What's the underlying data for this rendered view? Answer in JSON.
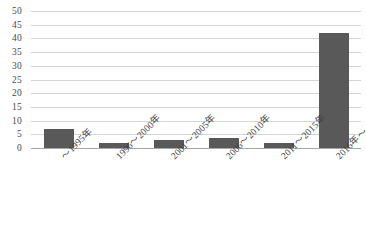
{
  "chart_data": {
    "type": "bar",
    "title": "",
    "subtitle": "",
    "xlabel": "",
    "ylabel": "",
    "categories": [
      "～1995年",
      "1996～2000年",
      "2001～2005年",
      "2006～2010年",
      "2011～2015年",
      "2016年～"
    ],
    "values": [
      7,
      2,
      3,
      3.5,
      2,
      42
    ],
    "ylim": [
      0,
      50
    ],
    "ytick_labels": [
      "50",
      "45",
      "40",
      "35",
      "30",
      "25",
      "20",
      "15",
      "10",
      "5",
      "0"
    ],
    "ytick_values": [
      50,
      45,
      40,
      35,
      30,
      25,
      20,
      15,
      10,
      5,
      0
    ],
    "grid": true,
    "legend": "none",
    "series_name": "",
    "colors": {
      "bar": "#595959",
      "gridline": "#d4d4d4",
      "axis": "#a6a6a6",
      "tick_text": "#4a4a4a",
      "category_text": "#3f3f3f",
      "background": "#ffffff"
    }
  }
}
